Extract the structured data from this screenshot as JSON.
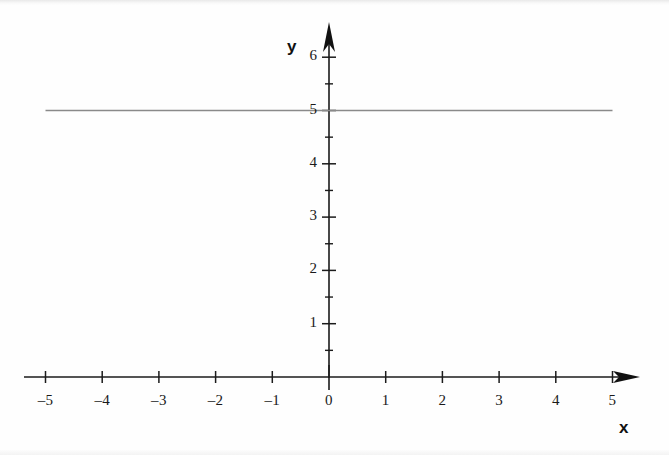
{
  "chart_data": {
    "type": "line",
    "title": "",
    "subtitle": "",
    "xlabel": "x",
    "ylabel": "y",
    "xlim": [
      -5,
      5
    ],
    "ylim": [
      0,
      6
    ],
    "grid": false,
    "legend": null,
    "x_ticks": [
      {
        "value": -5,
        "label": "–5"
      },
      {
        "value": -4,
        "label": "–4"
      },
      {
        "value": -3,
        "label": "–3"
      },
      {
        "value": -2,
        "label": "–2"
      },
      {
        "value": -1,
        "label": "–1"
      },
      {
        "value": 0,
        "label": "0"
      },
      {
        "value": 1,
        "label": "1"
      },
      {
        "value": 2,
        "label": "2"
      },
      {
        "value": 3,
        "label": "3"
      },
      {
        "value": 4,
        "label": "4"
      },
      {
        "value": 5,
        "label": "5"
      }
    ],
    "y_ticks": [
      {
        "value": 1,
        "label": "1"
      },
      {
        "value": 2,
        "label": "2"
      },
      {
        "value": 3,
        "label": "3"
      },
      {
        "value": 4,
        "label": "4"
      },
      {
        "value": 5,
        "label": "5"
      },
      {
        "value": 6,
        "label": "6"
      }
    ],
    "x_minor_ticks": [],
    "y_minor_ticks": [
      0.5,
      1.5,
      2.5,
      3.5,
      4.5,
      5.5
    ],
    "series": [
      {
        "name": "y = 5",
        "type": "line",
        "color": "#8a8a8a",
        "x": [
          -5,
          5
        ],
        "values": [
          5,
          5
        ]
      }
    ],
    "annotations": [],
    "axis_arrows": {
      "x_axis_arrow_at": 5,
      "y_axis_arrow_at": 6.45
    },
    "colors": {
      "axis": "#1b1b1b",
      "line": "#8a8a8a",
      "text": "#1a1a1a",
      "background": "#fefefe"
    }
  },
  "labels": {
    "x_axis_name": "x",
    "y_axis_name": "y"
  }
}
